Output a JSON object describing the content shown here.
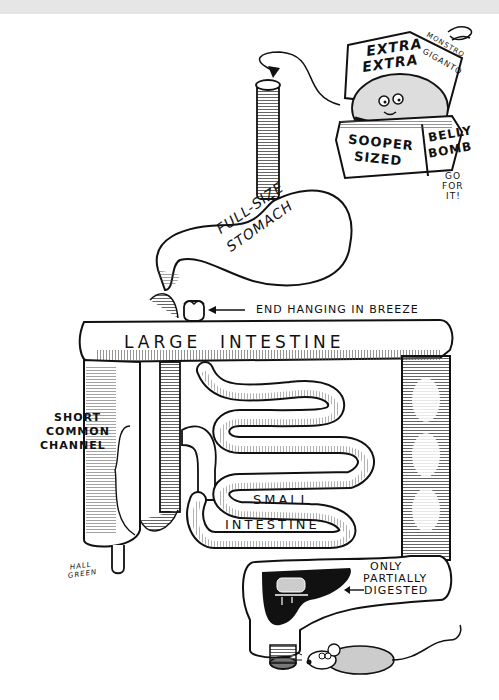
{
  "illustration": {
    "kind": "editorial cartoon",
    "subject": "digestive tract after gastric bypass-style surgery, fed a giant burger"
  },
  "burger_box": {
    "lid_text_1": "EXTRA",
    "lid_text_2": "EXTRA",
    "lid_side_1": "MONSTRO",
    "lid_side_2": "GIGANTO",
    "front_text_1": "SOOPER",
    "front_text_2": "SIZED",
    "side_text_1": "BELLY",
    "side_text_2": "BOMB",
    "caption_1": "GO",
    "caption_2": "FOR",
    "caption_3": "IT!"
  },
  "labels": {
    "stomach_1": "FULL-SIZE",
    "stomach_2": "STOMACH",
    "end_hanging": "END HANGING IN BREEZE",
    "large_intestine": "LARGE  INTESTINE",
    "short_channel_1": "SHORT",
    "short_channel_2": "COMMON",
    "short_channel_3": "CHANNEL",
    "small_intestine_1": "SMALL",
    "small_intestine_2": "INTESTINE",
    "only_1": "ONLY",
    "only_2": "PARTIALLY",
    "only_3": "DIGESTED"
  },
  "signature": {
    "line1": "HALL",
    "line2": "GREEN"
  },
  "colors": {
    "ink": "#111111",
    "paper": "#ffffff",
    "top_band": "#e6e6e6",
    "shade": "#9a9a9a"
  }
}
